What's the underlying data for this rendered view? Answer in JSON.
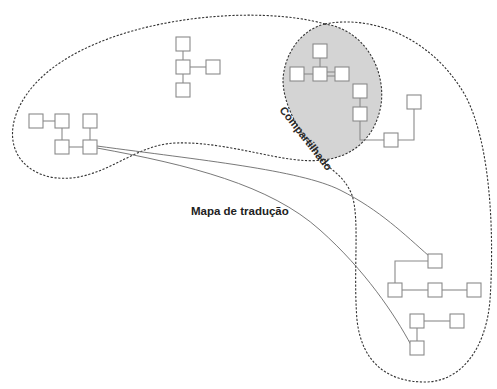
{
  "diagram": {
    "labels": {
      "shared_region": "Compartilhado",
      "translation_map": "Mapa de tradução"
    },
    "colors": {
      "shared_fill": "#d4d4d4",
      "outline": "#333333",
      "node_stroke": "#8a8a8a",
      "background": "#ffffff"
    },
    "regions": [
      {
        "id": "left-domain",
        "style": "dashed",
        "description": "large left cloud"
      },
      {
        "id": "right-domain",
        "style": "dashed",
        "description": "right cloud"
      },
      {
        "id": "shared",
        "style": "dashed-filled",
        "label_ref": "shared_region"
      }
    ],
    "node_clusters": [
      {
        "id": "top-center",
        "nodes": 4
      },
      {
        "id": "left",
        "nodes": 5
      },
      {
        "id": "shared",
        "nodes": 6
      },
      {
        "id": "right-upper",
        "nodes": 2
      },
      {
        "id": "bottom-right",
        "nodes": 7
      }
    ],
    "translation_links": [
      {
        "from": "left-cluster-node",
        "to": "bottom-right-top-node"
      },
      {
        "from": "left-cluster-node",
        "to": "bottom-right-bottom-node"
      }
    ]
  }
}
